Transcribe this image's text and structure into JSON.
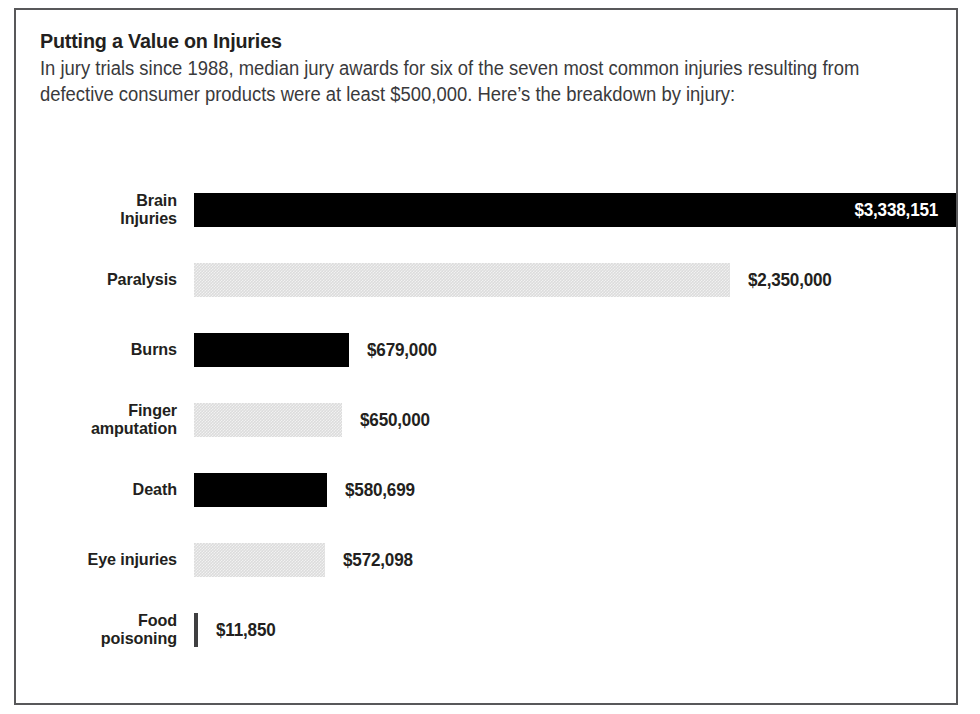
{
  "chart_data": {
    "type": "bar",
    "orientation": "horizontal",
    "title": "Putting a Value on Injuries",
    "subtitle": "In jury trials since 1988, median jury awards for six of the seven most common injuries resulting from defective consumer products were at least $500,000. Here’s the breakdown by injury:",
    "xlabel": "",
    "ylabel": "",
    "xlim": [
      0,
      3338151
    ],
    "grid": false,
    "legend": false,
    "categories": [
      "Brain Injuries",
      "Paralysis",
      "Burns",
      "Finger amputation",
      "Death",
      "Eye injuries",
      "Food poisoning"
    ],
    "values": [
      3338151,
      2350000,
      679000,
      650000,
      580699,
      572098,
      11850
    ],
    "value_labels": [
      "$3,338,151",
      "$2,350,000",
      "$679,000",
      "$650,000",
      "$580,699",
      "$572,098",
      "$11,850"
    ],
    "bars": [
      {
        "label": "Brain Injuries",
        "label_lines": [
          "Brain",
          "Injuries"
        ],
        "value": 3338151,
        "value_label": "$3,338,151",
        "fill": "dark",
        "label_position": "inside"
      },
      {
        "label": "Paralysis",
        "label_lines": [
          "Paralysis"
        ],
        "value": 2350000,
        "value_label": "$2,350,000",
        "fill": "light",
        "label_position": "outside"
      },
      {
        "label": "Burns",
        "label_lines": [
          "Burns"
        ],
        "value": 679000,
        "value_label": "$679,000",
        "fill": "dark",
        "label_position": "outside"
      },
      {
        "label": "Finger amputation",
        "label_lines": [
          "Finger",
          "amputation"
        ],
        "value": 650000,
        "value_label": "$650,000",
        "fill": "light",
        "label_position": "outside"
      },
      {
        "label": "Death",
        "label_lines": [
          "Death"
        ],
        "value": 580699,
        "value_label": "$580,699",
        "fill": "dark",
        "label_position": "outside"
      },
      {
        "label": "Eye injuries",
        "label_lines": [
          "Eye injuries"
        ],
        "value": 572098,
        "value_label": "$572,098",
        "fill": "light",
        "label_position": "outside"
      },
      {
        "label": "Food poisoning",
        "label_lines": [
          "Food",
          "poisoning"
        ],
        "value": 11850,
        "value_label": "$11,850",
        "fill": "sliver",
        "label_position": "outside"
      }
    ],
    "colors": {
      "bar_dark": "#000000",
      "bar_light": "#dcdcdc",
      "text": "#231f20",
      "subtitle_text": "#3a3a3c",
      "value_inside_text": "#ffffff",
      "background": "#ffffff",
      "border": "#58585a"
    }
  }
}
